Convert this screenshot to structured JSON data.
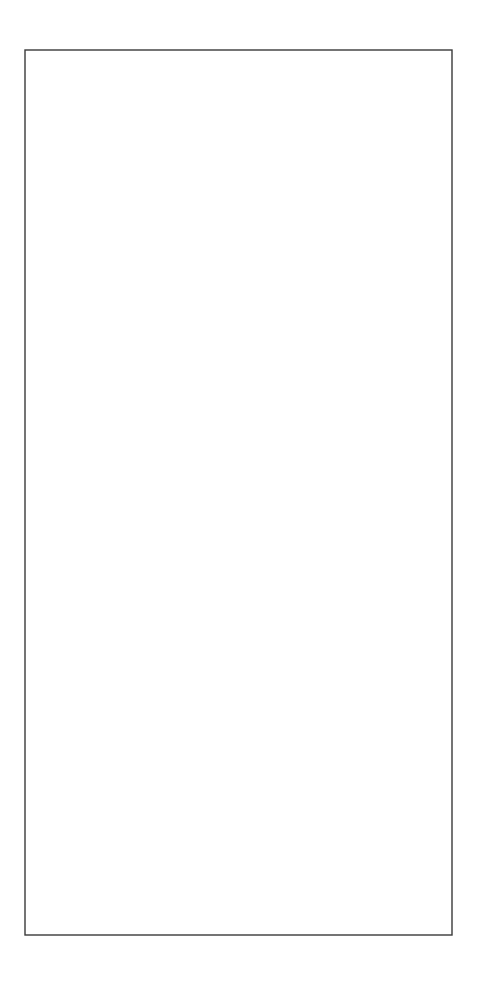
{
  "document": {
    "title": "Quilt Pattern Template Sheet",
    "background_color": "#ffffff",
    "width": 486,
    "height": 987
  },
  "frame": {
    "name": "outer-border-rectangle",
    "x": 25,
    "y": 50,
    "width": 427,
    "height": 885,
    "stroke_color": "#3a3a3a",
    "stroke_width": 1.4,
    "fill": "none"
  },
  "line_style": {
    "stroke_color": "#2b2b2b",
    "stroke_width": 1.5,
    "dash_length": 5,
    "dash_gap": 3.5,
    "linecap": "butt"
  },
  "blocks": [
    {
      "name": "pinwheel-block-top",
      "label": "Pinwheel Block 1",
      "x": 62,
      "y": 86,
      "width": 359,
      "height": 347,
      "center_x": 241.5,
      "center_y": 259.5,
      "rotation_symmetry": 4,
      "swirl_direction": "counter-clockwise"
    },
    {
      "name": "pinwheel-block-bottom",
      "label": "Pinwheel Block 2",
      "x": 62,
      "y": 550,
      "width": 359,
      "height": 347,
      "center_x": 241.5,
      "center_y": 723.5,
      "rotation_symmetry": 4,
      "swirl_direction": "counter-clockwise"
    }
  ],
  "geometry": {
    "note": "Unit-square parametric pinwheel. Each of the four identical arms is traced in a normalized 0..1 square then rotated by 0/90/180/270 degrees about the block center.",
    "arm_outline_path": "M 0.000 0.000 C 0.230 0.030 0.420 0.105 0.520 0.218 C 0.430 0.345 0.400 0.520 0.420 0.688 C 0.300 0.700 0.180 0.640 0.103 0.540 C 0.042 0.400 0.010 0.200 0.000 0.000 Z",
    "arm_outer_top_curve": "M 0.000 0.000 C 0.230 0.030 0.420 0.105 0.520 0.218",
    "arm_inner_sweep_curve": "M 0.520 0.218 C 0.430 0.345 0.400 0.520 0.420 0.688",
    "arm_inner_bottom_curve": "M 0.420 0.688 C 0.300 0.700 0.180 0.640 0.103 0.540",
    "arm_outer_left_curve": "M 0.103 0.540 C 0.042 0.400 0.010 0.200 0.000 0.000",
    "arm_count": 4,
    "arm_rotations_deg": [
      0,
      90,
      180,
      270
    ]
  },
  "annotations": {
    "stitch_line_type": "dashed",
    "visible_text": []
  }
}
